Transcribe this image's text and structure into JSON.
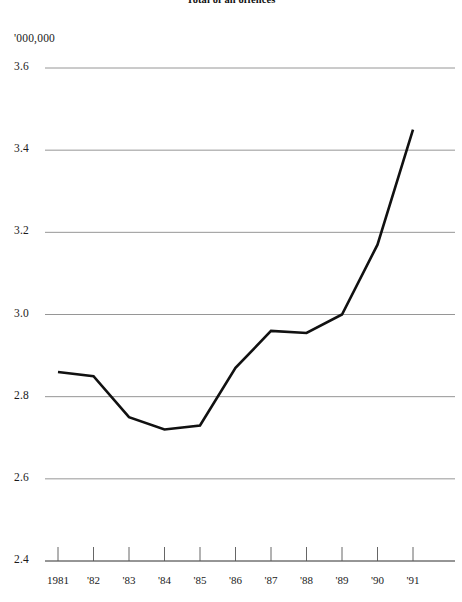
{
  "chart_data": {
    "type": "line",
    "title": "Total of all offences",
    "subtitle": "",
    "unit_label": "'000,000",
    "xlabel": "",
    "ylabel": "",
    "categories": [
      "1981",
      "'82",
      "'83",
      "'84",
      "'85",
      "'86",
      "'87",
      "'88",
      "'89",
      "'90",
      "'91"
    ],
    "x_values": [
      1981,
      1982,
      1983,
      1984,
      1985,
      1986,
      1987,
      1988,
      1989,
      1990,
      1991
    ],
    "values": [
      2.86,
      2.85,
      2.75,
      2.72,
      2.73,
      2.87,
      2.96,
      2.955,
      3.0,
      3.17,
      3.45
    ],
    "series": [
      {
        "name": "Total of all offences",
        "values": [
          2.86,
          2.85,
          2.75,
          2.72,
          2.73,
          2.87,
          2.96,
          2.955,
          3.0,
          3.17,
          3.45
        ],
        "color": "#111111"
      }
    ],
    "ylim": [
      2.4,
      3.6
    ],
    "yticks": [
      2.4,
      2.6,
      2.8,
      3.0,
      3.2,
      3.4,
      3.6
    ],
    "ytick_labels": [
      "2.4",
      "2.6",
      "2.8",
      "3.0",
      "3.2",
      "3.4",
      "3.6"
    ],
    "grid": true,
    "grid_color": "#8a8a8a",
    "axis_color": "#555555",
    "legend": false,
    "legend_position": "none"
  },
  "chart": {
    "title": "Total of all offences",
    "unit_label": "'000,000"
  }
}
